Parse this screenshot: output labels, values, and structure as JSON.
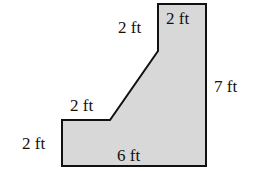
{
  "diagram": {
    "type": "composite-shape-dimensions",
    "fill_color": "#d8d8d8",
    "stroke_color": "#111111",
    "shape_points": [
      [
        62,
        120
      ],
      [
        110,
        120
      ],
      [
        158,
        51
      ],
      [
        158,
        4
      ],
      [
        206,
        4
      ],
      [
        206,
        166
      ],
      [
        62,
        166
      ]
    ],
    "labels": {
      "top_width": "2 ft",
      "upper_left_vertical": "2 ft",
      "right_height": "7 ft",
      "step_width": "2 ft",
      "left_height": "2 ft",
      "bottom_width": "6 ft"
    }
  }
}
